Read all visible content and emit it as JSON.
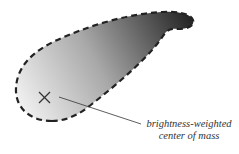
{
  "diagram": {
    "annotation": {
      "line1": "brightness-weighted",
      "line2": "center of mass"
    },
    "colors": {
      "gradient_light": "#eeeeee",
      "gradient_dark": "#2a2a2a",
      "outline": "#222222",
      "marker": "#333333",
      "text": "#333333"
    },
    "marker": {
      "x": 44,
      "y": 97,
      "symbol": "x-mark"
    }
  }
}
